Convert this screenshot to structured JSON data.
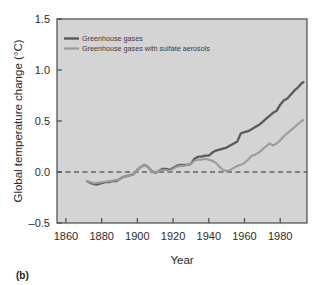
{
  "panel": {
    "label": "(b)"
  },
  "colors": {
    "plot_background": "#d4d4d4",
    "axis": "#4a4a4a",
    "series_1": "#5a5a5a",
    "series_2": "#9b9b9b",
    "zero_line": "#2b2b2b",
    "text": "#2b2b2b"
  },
  "chart_data": {
    "type": "line",
    "title": "",
    "xlabel": "Year",
    "ylabel": "Global temperature change (°C)",
    "xlim": [
      1855,
      1995
    ],
    "ylim": [
      -0.5,
      1.5
    ],
    "xticks": [
      1860,
      1880,
      1900,
      1920,
      1940,
      1960,
      1980
    ],
    "yticks": [
      -0.5,
      0.0,
      0.5,
      1.0,
      1.5
    ],
    "ytick_labels": [
      "–0.5",
      "0.0",
      "0.5",
      "1.0",
      "1.5"
    ],
    "xtick_labels": [
      "1860",
      "1880",
      "1900",
      "1920",
      "1940",
      "1960",
      "1980"
    ],
    "grid": false,
    "legend_position": "top-left",
    "annotations": [
      {
        "type": "hline",
        "y": 0.0,
        "style": "dashed",
        "label": "zero reference"
      }
    ],
    "series": [
      {
        "name": "Greenhouse gases",
        "color": "#5a5a5a",
        "x": [
          1872,
          1874,
          1876,
          1878,
          1880,
          1882,
          1884,
          1886,
          1888,
          1890,
          1892,
          1894,
          1896,
          1898,
          1900,
          1902,
          1904,
          1906,
          1908,
          1910,
          1912,
          1914,
          1916,
          1918,
          1920,
          1922,
          1924,
          1926,
          1928,
          1930,
          1932,
          1934,
          1936,
          1938,
          1940,
          1942,
          1944,
          1946,
          1948,
          1950,
          1952,
          1954,
          1956,
          1958,
          1960,
          1962,
          1964,
          1966,
          1968,
          1970,
          1972,
          1974,
          1976,
          1978,
          1980,
          1982,
          1984,
          1986,
          1988,
          1990,
          1992,
          1993
        ],
        "y": [
          -0.09,
          -0.11,
          -0.12,
          -0.12,
          -0.11,
          -0.1,
          -0.1,
          -0.09,
          -0.09,
          -0.07,
          -0.05,
          -0.04,
          -0.03,
          -0.02,
          0.02,
          0.05,
          0.07,
          0.05,
          0.01,
          -0.01,
          0.01,
          0.03,
          0.03,
          0.02,
          0.04,
          0.06,
          0.07,
          0.07,
          0.07,
          0.08,
          0.13,
          0.15,
          0.15,
          0.16,
          0.16,
          0.19,
          0.21,
          0.22,
          0.23,
          0.24,
          0.26,
          0.28,
          0.3,
          0.38,
          0.39,
          0.4,
          0.42,
          0.44,
          0.46,
          0.49,
          0.52,
          0.55,
          0.58,
          0.6,
          0.66,
          0.7,
          0.72,
          0.76,
          0.8,
          0.83,
          0.87,
          0.88
        ]
      },
      {
        "name": "Greenhouse gases with sulfate aerosols",
        "color": "#9b9b9b",
        "x": [
          1872,
          1876,
          1880,
          1884,
          1888,
          1890,
          1892,
          1894,
          1896,
          1898,
          1900,
          1902,
          1904,
          1906,
          1908,
          1910,
          1912,
          1914,
          1916,
          1918,
          1920,
          1922,
          1924,
          1926,
          1928,
          1930,
          1932,
          1934,
          1936,
          1938,
          1940,
          1942,
          1944,
          1946,
          1948,
          1950,
          1952,
          1954,
          1956,
          1958,
          1960,
          1962,
          1964,
          1966,
          1968,
          1970,
          1972,
          1974,
          1976,
          1978,
          1980,
          1982,
          1984,
          1986,
          1988,
          1990,
          1992,
          1993
        ],
        "y": [
          -0.09,
          -0.11,
          -0.1,
          -0.09,
          -0.08,
          -0.07,
          -0.05,
          -0.04,
          -0.03,
          -0.02,
          0.02,
          0.05,
          0.07,
          0.05,
          0.01,
          -0.01,
          0.01,
          0.02,
          0.02,
          0.01,
          0.03,
          0.05,
          0.06,
          0.06,
          0.07,
          0.08,
          0.11,
          0.12,
          0.12,
          0.13,
          0.12,
          0.11,
          0.09,
          0.05,
          0.02,
          0.01,
          0.02,
          0.04,
          0.06,
          0.07,
          0.09,
          0.12,
          0.16,
          0.17,
          0.19,
          0.22,
          0.25,
          0.28,
          0.26,
          0.28,
          0.31,
          0.35,
          0.38,
          0.41,
          0.44,
          0.47,
          0.5,
          0.51
        ]
      }
    ]
  }
}
